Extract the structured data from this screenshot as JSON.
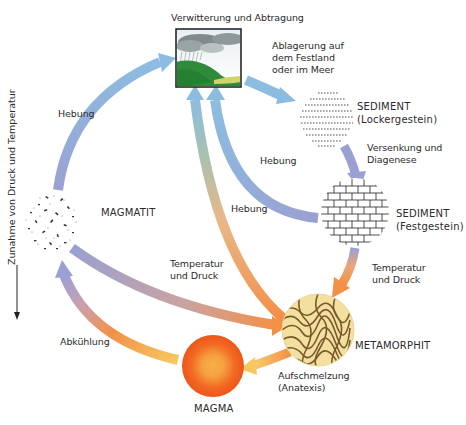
{
  "diagram": {
    "side_axis": {
      "label": "Zunahme von Druck und Temperatur",
      "direction": "down"
    },
    "nodes": [
      {
        "id": "weathering",
        "label": "Verwitterung und Abtragung",
        "icon": "weathering-landscape-icon"
      },
      {
        "id": "sediment_loose",
        "label": "SEDIMENT",
        "sublabel": "(Lockergestein)",
        "icon": "loose-sediment-icon"
      },
      {
        "id": "sediment_solid",
        "label": "SEDIMENT",
        "sublabel": "(Festgestein)",
        "icon": "solid-sediment-icon"
      },
      {
        "id": "metamorphit",
        "label": "METAMORPHIT",
        "icon": "metamorphic-rock-icon"
      },
      {
        "id": "magma",
        "label": "MAGMA",
        "icon": "magma-icon"
      },
      {
        "id": "magmatit",
        "label": "MAGMATIT",
        "icon": "igneous-rock-icon"
      }
    ],
    "edges": [
      {
        "from": "weathering",
        "to": "sediment_loose",
        "label_lines": [
          "Ablagerung auf",
          "dem Festland",
          "oder im Meer"
        ]
      },
      {
        "from": "sediment_loose",
        "to": "sediment_solid",
        "label_lines": [
          "Versenkung und",
          "Diagenese"
        ]
      },
      {
        "from": "sediment_solid",
        "to": "metamorphit",
        "label_lines": [
          "Temperatur",
          "und Druck"
        ]
      },
      {
        "from": "metamorphit",
        "to": "magma",
        "label_lines": [
          "Aufschmelzung",
          "(Anatexis)"
        ]
      },
      {
        "from": "magma",
        "to": "magmatit",
        "label_lines": [
          "Abkühlung"
        ]
      },
      {
        "from": "magmatit",
        "to": "weathering",
        "label_lines": [
          "Hebung"
        ]
      },
      {
        "from": "sediment_solid",
        "to": "weathering",
        "label_lines": [
          "Hebung"
        ]
      },
      {
        "from": "metamorphit",
        "to": "weathering",
        "label_lines": [
          "Hebung"
        ]
      },
      {
        "from": "magmatit",
        "to": "metamorphit",
        "label_lines": [
          "Temperatur",
          "und Druck"
        ]
      }
    ],
    "colors": {
      "arrow_cool": "#8fb8dc",
      "arrow_mid": "#9aa0d0",
      "arrow_hot": "#f39a50",
      "arrow_warm": "#f6c86a",
      "magma_outer": "#f05a1e",
      "magma_inner": "#f7a640",
      "grass": "#2f8a3a",
      "metamorphic_bg": "#f3dfa0",
      "metamorphic_band": "#7a5a2a"
    }
  }
}
